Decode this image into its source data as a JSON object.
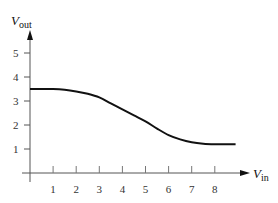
{
  "chart_data": {
    "type": "line",
    "title": "",
    "xlabel": "V_in",
    "ylabel": "V_out",
    "xlabel_main": "V",
    "xlabel_sub": "in",
    "ylabel_main": "V",
    "ylabel_sub": "out",
    "x_ticks": [
      "1",
      "2",
      "3",
      "4",
      "5",
      "6",
      "7",
      "8"
    ],
    "y_ticks": [
      "1",
      "2",
      "3",
      "4",
      "5"
    ],
    "xlim": [
      0,
      9.2
    ],
    "ylim": [
      0,
      5.8
    ],
    "grid": false,
    "legend": null,
    "series": [
      {
        "name": "V_out",
        "x": [
          0,
          0.5,
          1,
          1.5,
          2,
          2.5,
          3,
          3.5,
          4,
          4.5,
          5,
          5.5,
          6,
          6.5,
          7,
          7.5,
          8,
          8.5,
          8.9
        ],
        "y": [
          3.5,
          3.5,
          3.5,
          3.47,
          3.4,
          3.3,
          3.15,
          2.9,
          2.65,
          2.4,
          2.15,
          1.85,
          1.58,
          1.4,
          1.28,
          1.22,
          1.2,
          1.2,
          1.2
        ]
      }
    ]
  }
}
